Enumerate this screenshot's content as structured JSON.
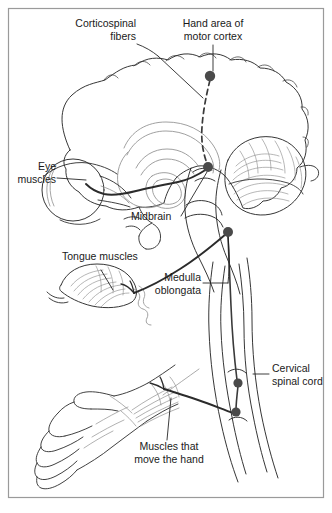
{
  "figure": {
    "title_region": "anatomical-diagram",
    "background_color": "#ffffff",
    "frame_color": "#9a9a9a",
    "line_color": "#2b2b2b",
    "faint_line_color": "#8f8f8f",
    "tract_color": "#3a3a3a",
    "node_color": "#4a4a4a",
    "leader_color": "#1a1a1a"
  },
  "labels": {
    "corticospinal_fibers": "Corticospinal\nfibers",
    "hand_area_motor_cortex": "Hand area of\nmotor cortex",
    "eye_muscles": "Eye\nmuscles",
    "midbrain": "Midbrain",
    "tongue_muscles": "Tongue muscles",
    "medulla_oblongata": "Medulla\noblongata",
    "cervical_spinal_cord": "Cervical\nspinal cord",
    "muscles_move_hand": "Muscles that\nmove the hand"
  },
  "structures": [
    {
      "name": "cerebrum",
      "kind": "outline"
    },
    {
      "name": "corpus-callosum",
      "kind": "outline"
    },
    {
      "name": "cerebellum",
      "kind": "outline"
    },
    {
      "name": "brainstem",
      "kind": "outline"
    },
    {
      "name": "eyeball",
      "kind": "outline"
    },
    {
      "name": "tongue",
      "kind": "outline"
    },
    {
      "name": "hand",
      "kind": "outline"
    },
    {
      "name": "neck-spinal-cord",
      "kind": "outline"
    }
  ],
  "nodes": [
    {
      "name": "motor-cortex-node",
      "x": 210,
      "y": 76
    },
    {
      "name": "midbrain-node",
      "x": 208,
      "y": 167
    },
    {
      "name": "medulla-node",
      "x": 228,
      "y": 232
    },
    {
      "name": "cervical-upper-node",
      "x": 238,
      "y": 383
    },
    {
      "name": "cervical-lower-node",
      "x": 236,
      "y": 412
    }
  ]
}
